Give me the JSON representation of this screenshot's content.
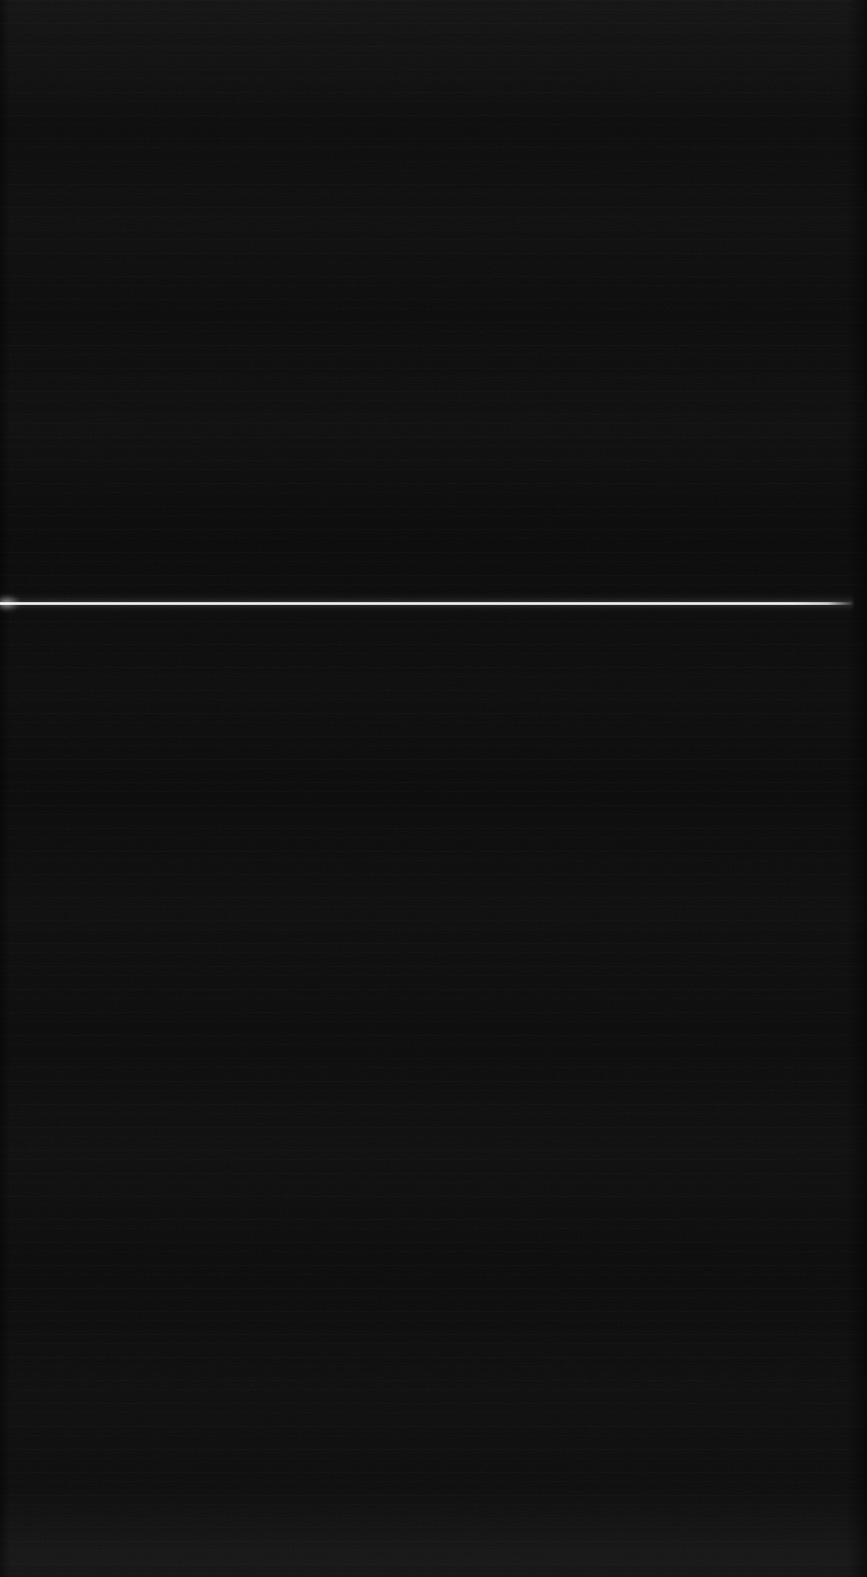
{
  "screen": {
    "width": 867,
    "height": 1577,
    "state_label": "blank",
    "background_color": "#0a0a0a",
    "top_edge_color": "#141414",
    "bottom_edge_color": "#141414",
    "has_visible_text": false,
    "has_visible_controls": false
  },
  "divider": {
    "name": "horizontal-divider-line",
    "color": "#f2f2f2",
    "glow_color": "#ffffff",
    "top_px": 593,
    "left_px": 0,
    "width_px": 853,
    "core_height_px": 3,
    "glow_height_px": 20,
    "orientation": "horizontal",
    "fades_at_right_end": true
  },
  "texture": {
    "name": "compression-noise",
    "description": "faint horizontal banding and speckle across the dark field",
    "band_opacity": 0.016,
    "noise_opacity": 0.55
  },
  "edges": {
    "left_shade_width_px": 10,
    "right_shade_width_px": 20,
    "shade_color": "#000000"
  },
  "accessibility": {
    "region_label": "Blank dark screen with a single bright horizontal divider line"
  }
}
